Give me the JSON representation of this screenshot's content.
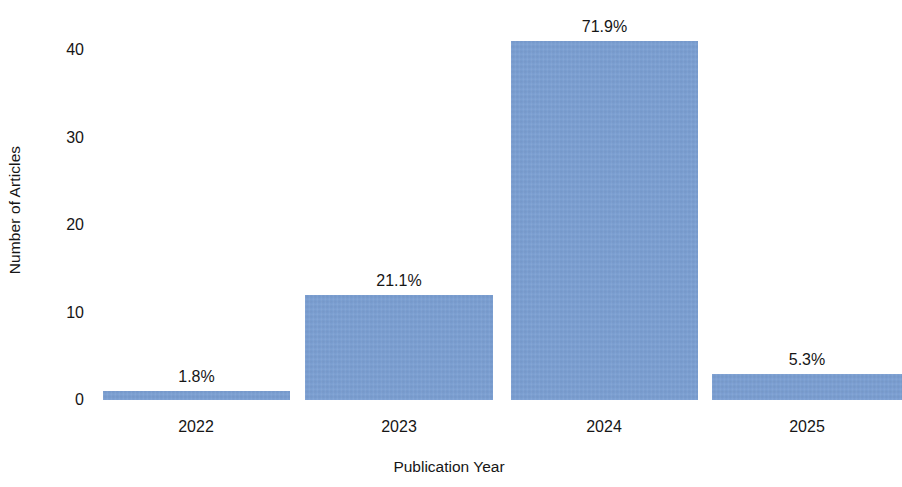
{
  "chart_data": {
    "type": "bar",
    "title": "",
    "subtitle": "",
    "xlabel": "Publication Year",
    "ylabel": "Number of Articles",
    "categories": [
      "2022",
      "2023",
      "2024",
      "2025"
    ],
    "values": [
      1,
      12,
      41,
      3
    ],
    "data_labels": [
      "1.8%",
      "21.1%",
      "71.9%",
      "5.3%"
    ],
    "percentages": [
      1.8,
      21.1,
      71.9,
      5.3
    ],
    "series": [
      {
        "name": "Number of Articles",
        "values": [
          1,
          12,
          41,
          3
        ]
      }
    ],
    "ylim": [
      0,
      41
    ],
    "yticks": [
      0,
      10,
      20,
      30,
      40
    ],
    "ytick_labels": [
      "0",
      "10",
      "20",
      "30",
      "40"
    ],
    "grid": false,
    "legend": false,
    "legend_position": "none",
    "bar_color": "#7ca0d4",
    "background_color": "#ffffff",
    "text_color": "#161616"
  },
  "layout": {
    "plot_left_px": 96,
    "plot_width_px": 802,
    "baseline_y_px": 400,
    "px_per_unit": 8.75,
    "bars": [
      {
        "left_px": 7,
        "width_px": 187,
        "center_px": 100
      },
      {
        "left_px": 209,
        "width_px": 188,
        "center_px": 303
      },
      {
        "left_px": 415,
        "width_px": 187,
        "center_px": 508
      },
      {
        "left_px": 616,
        "width_px": 190,
        "center_px": 711
      }
    ],
    "ytick_y_px": [
      400,
      312.5,
      225,
      137.5,
      50
    ]
  }
}
